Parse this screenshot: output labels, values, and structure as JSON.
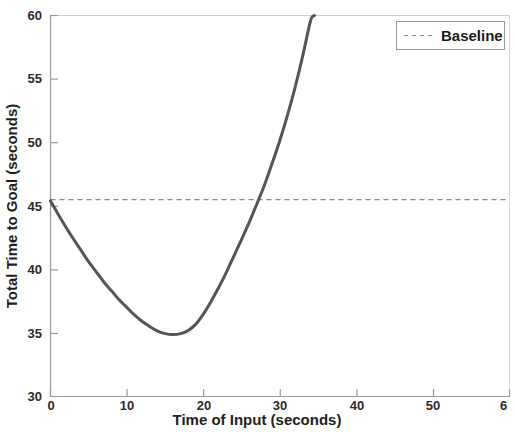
{
  "chart_data": {
    "type": "line",
    "title": "",
    "xlabel": "Time of Input (seconds)",
    "ylabel": "Total Time to Goal (seconds)",
    "xlim": [
      0,
      60
    ],
    "ylim": [
      30,
      60
    ],
    "xticks": [
      0,
      10,
      20,
      30,
      40,
      50,
      60
    ],
    "xtick_labels": [
      "0",
      "10",
      "20",
      "30",
      "40",
      "50",
      "6"
    ],
    "yticks": [
      30,
      35,
      40,
      45,
      50,
      55,
      60
    ],
    "ytick_labels": [
      "30",
      "35",
      "40",
      "45",
      "50",
      "55",
      "60"
    ],
    "grid": false,
    "legend_position": "top-right",
    "legend": [
      {
        "label": "Baseline",
        "style": "dashed",
        "color": "#8a8a8a"
      }
    ],
    "series": [
      {
        "name": "Total time to goal",
        "style": "solid",
        "color": "#555555",
        "linewidth": 3,
        "clipped_at_top": true,
        "x": [
          0,
          1,
          2,
          3,
          4,
          5,
          6,
          7,
          8,
          9,
          10,
          11,
          12,
          13,
          14,
          15,
          16,
          17,
          18,
          19,
          20,
          21,
          22,
          23,
          24,
          25,
          26,
          27,
          28,
          29,
          30,
          31,
          32,
          33,
          34,
          34.5
        ],
        "y": [
          45.4,
          44.35,
          43.35,
          42.4,
          41.5,
          40.6,
          39.8,
          39.0,
          38.3,
          37.6,
          37.0,
          36.4,
          35.9,
          35.5,
          35.15,
          34.95,
          34.88,
          34.95,
          35.2,
          35.7,
          36.5,
          37.5,
          38.6,
          39.8,
          41.1,
          42.4,
          43.75,
          45.2,
          46.7,
          48.4,
          50.2,
          52.2,
          54.4,
          56.9,
          59.6,
          60.0
        ]
      },
      {
        "name": "Baseline",
        "style": "dashed",
        "color": "#8a8a8a",
        "linewidth": 1,
        "constant_y": 45.5,
        "x": [
          0,
          60
        ],
        "y": [
          45.5,
          45.5
        ]
      }
    ],
    "annotations": {
      "minimum": {
        "x": 16,
        "y": 34.9
      },
      "baseline_crossing_x": 26.5,
      "reaches_top_at_x": 34.5,
      "start_point": {
        "x": 0,
        "y": 45.4
      }
    }
  }
}
